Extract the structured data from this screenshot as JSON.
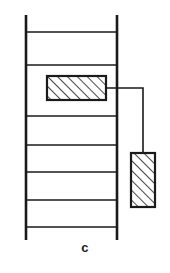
{
  "figure": {
    "caption": "c",
    "caption_x": 73,
    "caption_y": 240,
    "caption_font_size": 13,
    "background_color": "#ffffff",
    "line_color": "#1a1a1a",
    "hatch_color": "#1a1a1a",
    "canvas": {
      "width": 170,
      "height": 273
    }
  },
  "ladder": {
    "name": "ladder-frame",
    "rail_stroke_width": 2.6,
    "rung_stroke_width": 1.6,
    "left_rail": {
      "x": 26,
      "y1": 15,
      "y2": 240
    },
    "right_rail": {
      "x": 117,
      "y1": 15,
      "y2": 240
    },
    "rungs": [
      {
        "label": "rung-1",
        "y": 32
      },
      {
        "label": "rung-2",
        "y": 65
      },
      {
        "label": "rung-3",
        "y": 116
      },
      {
        "label": "rung-4",
        "y": 145
      },
      {
        "label": "rung-5",
        "y": 172
      },
      {
        "label": "rung-6",
        "y": 200
      },
      {
        "label": "rung-7",
        "y": 227
      }
    ],
    "rung_count": 7
  },
  "blocks": [
    {
      "id": "upper-hatched-block",
      "label": "upper hatched block",
      "x": 47,
      "y": 76,
      "width": 59,
      "height": 24,
      "stroke_width": 2.2,
      "hatch_direction": "forward-slash",
      "hatch_spacing": 7,
      "hatch_stroke_width": 1.6
    },
    {
      "id": "lower-hatched-block",
      "label": "lower hatched block",
      "x": 131,
      "y": 153,
      "width": 24,
      "height": 54,
      "stroke_width": 2.2,
      "hatch_direction": "forward-slash",
      "hatch_spacing": 7,
      "hatch_stroke_width": 1.6
    }
  ],
  "connector": {
    "id": "block-connector",
    "label": "connector line",
    "stroke_width": 1.6,
    "points": "106,88 143,88 143,153"
  }
}
